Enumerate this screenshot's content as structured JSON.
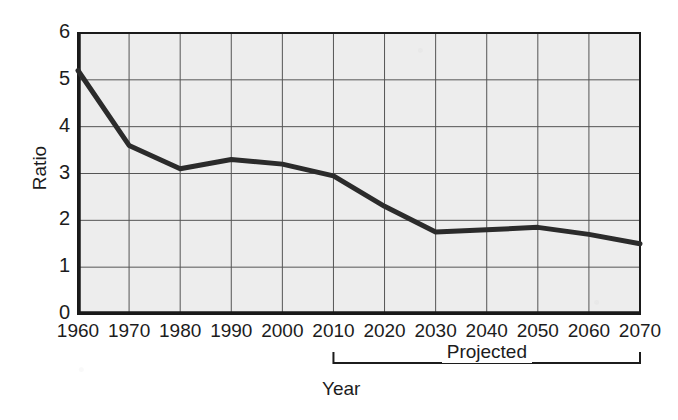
{
  "chart_data": {
    "type": "line",
    "title": "",
    "xlabel": "Year",
    "ylabel": "Ratio",
    "x": [
      1960,
      1970,
      1980,
      1990,
      2000,
      2010,
      2020,
      2030,
      2040,
      2050,
      2060,
      2070
    ],
    "values": [
      5.2,
      3.6,
      3.1,
      3.3,
      3.2,
      2.95,
      2.3,
      1.75,
      1.8,
      1.85,
      1.7,
      1.5
    ],
    "series": [
      {
        "name": "Ratio",
        "values": [
          5.2,
          3.6,
          3.1,
          3.3,
          3.2,
          2.95,
          2.3,
          1.75,
          1.8,
          1.85,
          1.7,
          1.5
        ]
      }
    ],
    "xlim": [
      1960,
      2070
    ],
    "ylim": [
      0,
      6
    ],
    "ytick_labels": [
      "0",
      "1",
      "2",
      "3",
      "4",
      "5",
      "6"
    ],
    "ytick_values": [
      0,
      1,
      2,
      3,
      4,
      5,
      6
    ],
    "xtick_labels": [
      "1960",
      "1970",
      "1980",
      "1990",
      "2000",
      "2010",
      "2020",
      "2030",
      "2040",
      "2050",
      "2060",
      "2070"
    ],
    "xtick_values": [
      1960,
      1970,
      1980,
      1990,
      2000,
      2010,
      2020,
      2030,
      2040,
      2050,
      2060,
      2070
    ],
    "grid": true,
    "legend": "none",
    "annotations": [
      {
        "text": "Projected",
        "type": "bracket",
        "x_start": 2010,
        "x_end": 2070
      }
    ],
    "colors": {
      "line": "#2b2b2b",
      "plot_background": "#ededed",
      "grid": "#555555",
      "axis": "#1a1a1a",
      "text": "#1c1c1c",
      "page_background": "#ffffff"
    },
    "line_width": 5
  },
  "axes": {
    "y_title": "Ratio",
    "x_title": "Year"
  },
  "projected": {
    "label": "Projected"
  }
}
